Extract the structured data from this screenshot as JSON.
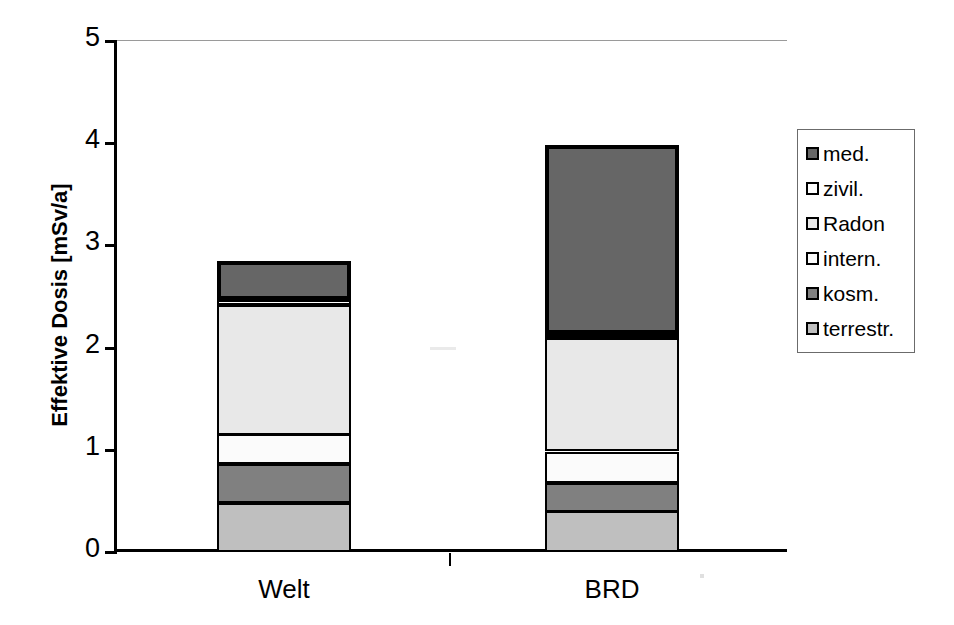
{
  "chart_data": {
    "type": "bar",
    "stacked": true,
    "title": "",
    "xlabel": "",
    "ylabel": "Effektive Dosis [mSv/a]",
    "categories": [
      "Welt",
      "BRD"
    ],
    "ylim": [
      0,
      5
    ],
    "ytick_labels": [
      "0",
      "1",
      "2",
      "3",
      "4",
      "5"
    ],
    "ytick_values": [
      0,
      1,
      2,
      3,
      4,
      5
    ],
    "minor_gridline_step": 0.2,
    "grid": true,
    "legend_position": "right",
    "series": [
      {
        "name": "terrestr.",
        "values": [
          0.48,
          0.4
        ],
        "color": "#bfbfbf"
      },
      {
        "name": "kosm.",
        "values": [
          0.38,
          0.28
        ],
        "color": "#808080"
      },
      {
        "name": "intern.",
        "values": [
          0.29,
          0.3
        ],
        "color": "#fbfbfb"
      },
      {
        "name": "Radon",
        "values": [
          1.27,
          1.11
        ],
        "color": "#e8e8e8"
      },
      {
        "name": "zivil.",
        "values": [
          0.05,
          0.04
        ],
        "color": "#ffffff"
      },
      {
        "name": "med.",
        "values": [
          0.38,
          1.85
        ],
        "color": "#666666"
      }
    ],
    "totals": [
      2.85,
      3.98
    ]
  },
  "legend": {
    "entries": [
      {
        "label": "med.",
        "color": "#666666"
      },
      {
        "label": "zivil.",
        "color": "#ffffff"
      },
      {
        "label": "Radon",
        "color": "#e8e8e8"
      },
      {
        "label": "intern.",
        "color": "#fbfbfb"
      },
      {
        "label": "kosm.",
        "color": "#808080"
      },
      {
        "label": "terrestr.",
        "color": "#bfbfbf"
      }
    ]
  },
  "axis": {
    "y_title": "Effektive Dosis [mSv/a]",
    "y_labels": [
      "5",
      "4",
      "3",
      "2",
      "1",
      "0"
    ],
    "x_labels": [
      "Welt",
      "BRD"
    ]
  }
}
